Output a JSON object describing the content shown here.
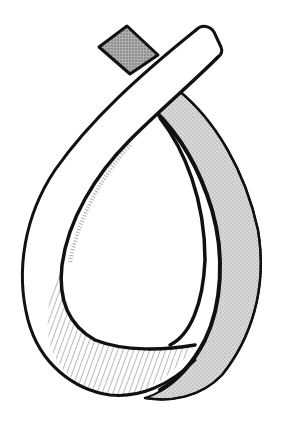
{
  "illustration": {
    "subject": "Looped twisted ribbon (Möbius-style strip) drawing",
    "style": "black ink line drawing with stippled grey shading",
    "colors": {
      "background": "#ffffff",
      "ink": "#111111",
      "front_band_fill": "#ffffff",
      "back_band_fill": "#d4d4d4",
      "top_end_fill": "#a8a8a8",
      "hatching": "#333333"
    }
  }
}
